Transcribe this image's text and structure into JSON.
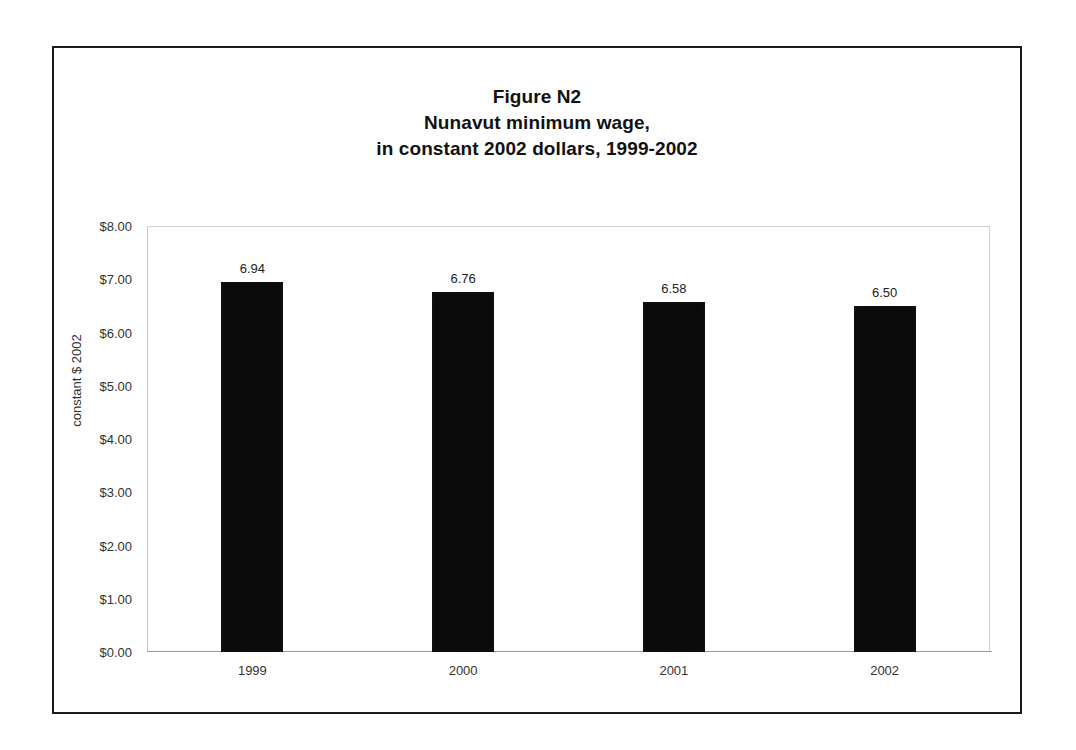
{
  "figure": {
    "title_lines": [
      "Figure N2",
      "Nunavut minimum wage,",
      "in constant 2002 dollars, 1999-2002"
    ],
    "frame_color": "#1a1a1a",
    "bar_color": "#0b0b0b",
    "axis_text_color": "#333333"
  },
  "chart_data": {
    "type": "bar",
    "title": "Figure N2 Nunavut minimum wage, in constant 2002 dollars, 1999-2002",
    "categories": [
      "1999",
      "2000",
      "2001",
      "2002"
    ],
    "values": [
      6.94,
      6.76,
      6.58,
      6.5
    ],
    "value_labels": [
      "6.94",
      "6.76",
      "6.58",
      "6.50"
    ],
    "xlabel": "",
    "ylabel": "constant $ 2002",
    "ylim": [
      0,
      8
    ],
    "ytick_values": [
      0,
      1,
      2,
      3,
      4,
      5,
      6,
      7,
      8
    ],
    "ytick_labels": [
      "$0.00",
      "$1.00",
      "$2.00",
      "$3.00",
      "$4.00",
      "$5.00",
      "$6.00",
      "$7.00",
      "$8.00"
    ],
    "grid": false,
    "legend": false,
    "series_color": "#0b0b0b"
  }
}
